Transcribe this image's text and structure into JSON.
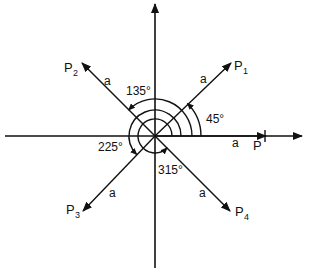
{
  "diagram": {
    "title": "",
    "origin": {
      "x": 155,
      "y": 136
    },
    "vectors": [
      {
        "name": "P",
        "angle_deg": 0,
        "label": "P",
        "length_label": "a"
      },
      {
        "name": "P1",
        "angle_deg": 45,
        "label": "P",
        "subscript": "1",
        "length_label": "a"
      },
      {
        "name": "P2",
        "angle_deg": 135,
        "label": "P",
        "subscript": "2",
        "length_label": "a"
      },
      {
        "name": "P3",
        "angle_deg": 225,
        "label": "P",
        "subscript": "3",
        "length_label": "a"
      },
      {
        "name": "P4",
        "angle_deg": 315,
        "label": "P",
        "subscript": "4",
        "length_label": "a"
      }
    ],
    "angle_labels": {
      "a45": "45°",
      "a135": "135°",
      "a225": "225°",
      "a315": "315°"
    },
    "stroke_color": "#111111",
    "background": "#ffffff"
  }
}
